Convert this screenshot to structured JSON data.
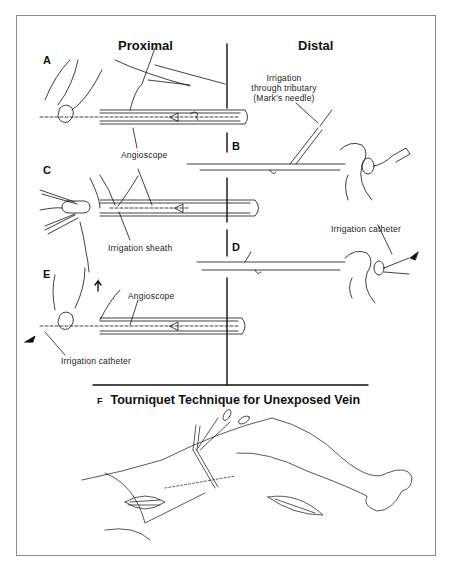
{
  "figure": {
    "columns": {
      "proximal": "Proximal",
      "distal": "Distal"
    },
    "panels": {
      "A": "A",
      "B": "B",
      "C": "C",
      "D": "D",
      "E": "E",
      "F": "F"
    },
    "labels": {
      "irrigation_tributary_line1": "Irrigation",
      "irrigation_tributary_line2": "through tributary",
      "irrigation_tributary_line3": "(Mark's needle)",
      "angioscope_ac": "Angioscope",
      "irrigation_sheath": "Irrigation sheath",
      "irrigation_catheter_d": "Irrigation catheter",
      "angioscope_e": "Angioscope",
      "irrigation_catheter_e": "Irrigation catheter"
    },
    "section_f_title": "Tourniquet Technique for Unexposed Vein",
    "colors": {
      "ink": "#111111",
      "frame": "#8a8a8a",
      "background": "#ffffff"
    }
  }
}
